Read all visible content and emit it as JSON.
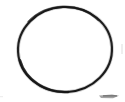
{
  "image": {
    "kind": "scanned-line-drawing",
    "alt_label": "circle outline",
    "width_px": 125,
    "height_px": 102,
    "background_color": "#ffffff"
  },
  "shape": {
    "name": "circle",
    "style": "outline",
    "center_x": 65,
    "center_y": 49.5,
    "radius_x": 47,
    "radius_y": 42.5,
    "bounds": {
      "left_px": 18,
      "top_px": 7,
      "right_px": 112,
      "bottom_px": 92
    },
    "stroke_color": "#1c1c1c",
    "stroke_width_px": 2.1,
    "fill_color": "none",
    "rotation_deg": -3
  },
  "artifacts": {
    "label": "scan-noise",
    "bottom_right_smudge_color": "#5a5a5a",
    "bottom_right_smudge_opacity": 0.55,
    "edge_speckle_color": "#cfcfcf"
  },
  "chart_data": {
    "type": "scatter",
    "title": "",
    "subtitle": "",
    "xlabel": "",
    "ylabel": "",
    "grid": false,
    "legend_position": "none",
    "annotations": [
      "single unfilled circle outline, no labels or axes"
    ],
    "series": [
      {
        "name": "circle-outline",
        "x": [
          65
        ],
        "y": [
          49.5
        ],
        "values": [
          94
        ]
      }
    ]
  }
}
